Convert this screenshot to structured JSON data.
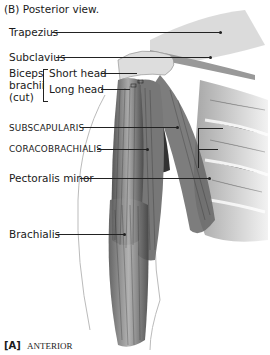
{
  "figure": {
    "caption_top": "(B) Posterior view.",
    "caption_bottom_letter": "[A]",
    "caption_bottom_text": "ANTERIOR",
    "labels": {
      "trapezius": "Trapezius",
      "subclavius": "Subclavius",
      "biceps_group_line1": "Biceps",
      "biceps_group_line2": "brachii",
      "biceps_group_line3": "(cut)",
      "short_head": "Short head",
      "long_head": "Long head",
      "subscapularis": "SUBSCAPULARIS",
      "coracobrachialis": "CORACOBRACHIALIS",
      "pectoralis_minor": "Pectoralis minor",
      "brachialis": "Brachialis"
    }
  }
}
